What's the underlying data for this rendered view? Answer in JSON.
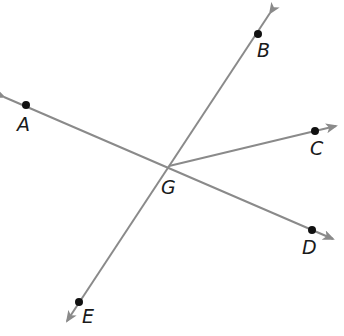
{
  "diagram": {
    "type": "geometry-rays",
    "colors": {
      "line": "#8a8a8a",
      "point": "#111111",
      "label": "#1a1a1a",
      "background": "#ffffff"
    },
    "vertex": {
      "label": "G",
      "x": 169,
      "y": 166
    },
    "points": [
      {
        "label": "A",
        "x": 26,
        "y": 105
      },
      {
        "label": "B",
        "x": 258,
        "y": 34
      },
      {
        "label": "C",
        "x": 315,
        "y": 131
      },
      {
        "label": "D",
        "x": 312,
        "y": 230
      },
      {
        "label": "E",
        "x": 79,
        "y": 302
      }
    ],
    "lines": [
      {
        "name": "line-AD",
        "through": [
          "A",
          "G",
          "D"
        ]
      },
      {
        "name": "line-BE",
        "through": [
          "B",
          "G",
          "E"
        ]
      }
    ],
    "rays": [
      {
        "name": "ray-GC",
        "from": "G",
        "through": "C"
      }
    ]
  }
}
